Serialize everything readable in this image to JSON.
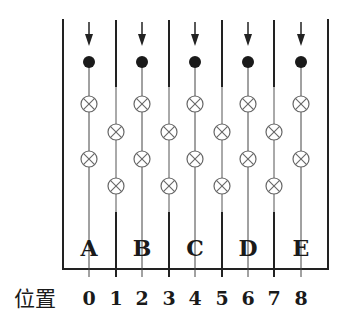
{
  "figure": {
    "type": "cross-section diagram of tubes with wires",
    "position_label": "位置",
    "positions": [
      "0",
      "1",
      "2",
      "3",
      "4",
      "5",
      "6",
      "7",
      "8"
    ],
    "compartments": [
      {
        "label": "A",
        "position": 0
      },
      {
        "label": "B",
        "position": 2
      },
      {
        "label": "C",
        "position": 4
      },
      {
        "label": "D",
        "position": 6
      },
      {
        "label": "E",
        "position": 8
      }
    ],
    "symbols": {
      "arrow": "down-arrow-icon",
      "filled_dot": "filled-circle",
      "current_into_page": "circle-cross ⊗"
    },
    "colors": {
      "line": "#222222",
      "thin_line": "#555555",
      "cross_circle": "#666666",
      "background": "#ffffff"
    }
  }
}
